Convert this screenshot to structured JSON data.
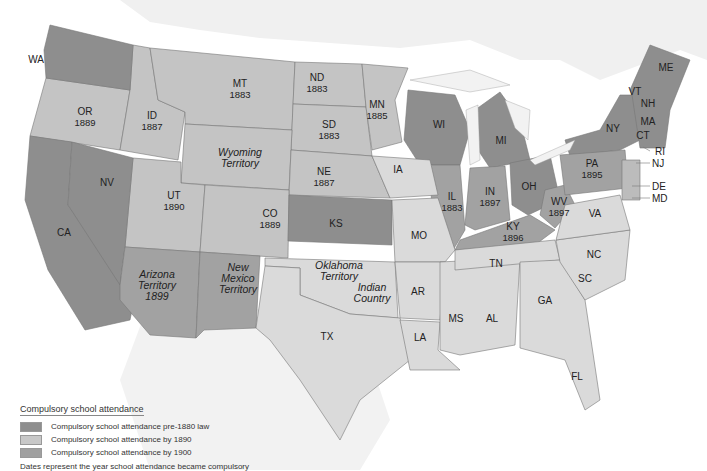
{
  "map": {
    "title": "Compulsory school attendance",
    "colors": {
      "pre1880": "#8e8e8e",
      "by1890": "#c4c4c4",
      "by1900": "#a2a2a2",
      "none": "#dcdcdc",
      "water": "#f4f4f4"
    },
    "labels": [
      {
        "id": "WA",
        "name": "WA",
        "year": "",
        "x": 36,
        "y": 59
      },
      {
        "id": "OR",
        "name": "OR",
        "year": "1889",
        "x": 85,
        "y": 117
      },
      {
        "id": "ID",
        "name": "ID",
        "year": "1887",
        "x": 152,
        "y": 121
      },
      {
        "id": "MT",
        "name": "MT",
        "year": "1883",
        "x": 240,
        "y": 89
      },
      {
        "id": "ND",
        "name": "ND",
        "year": "1883",
        "x": 317,
        "y": 83
      },
      {
        "id": "SD",
        "name": "SD",
        "year": "1883",
        "x": 329,
        "y": 130
      },
      {
        "id": "MN",
        "name": "MN",
        "year": "1885",
        "x": 377,
        "y": 110
      },
      {
        "id": "WY",
        "name": "Wyoming Territory",
        "year": "",
        "x": 240,
        "y": 158,
        "italic": true
      },
      {
        "id": "NE",
        "name": "NE",
        "year": "1887",
        "x": 324,
        "y": 177
      },
      {
        "id": "IA",
        "name": "IA",
        "year": "",
        "x": 398,
        "y": 169
      },
      {
        "id": "NV",
        "name": "NV",
        "year": "",
        "x": 107,
        "y": 182
      },
      {
        "id": "UT",
        "name": "UT",
        "year": "1890",
        "x": 174,
        "y": 201
      },
      {
        "id": "CO",
        "name": "CO",
        "year": "1889",
        "x": 270,
        "y": 219
      },
      {
        "id": "KS",
        "name": "KS",
        "year": "",
        "x": 336,
        "y": 223
      },
      {
        "id": "MO",
        "name": "MO",
        "year": "",
        "x": 419,
        "y": 235
      },
      {
        "id": "CA",
        "name": "CA",
        "year": "",
        "x": 64,
        "y": 232
      },
      {
        "id": "AZ",
        "name": "Arizona Territory 1899",
        "year": "",
        "x": 157,
        "y": 285,
        "italic": true
      },
      {
        "id": "NM",
        "name": "New Mexico Territory",
        "year": "",
        "x": 238,
        "y": 278,
        "italic": true
      },
      {
        "id": "OK",
        "name": "Oklahoma Territory",
        "year": "",
        "x": 339,
        "y": 271,
        "italic": true
      },
      {
        "id": "IC",
        "name": "Indian Country",
        "year": "",
        "x": 372,
        "y": 293,
        "italic": true
      },
      {
        "id": "TX",
        "name": "TX",
        "year": "",
        "x": 327,
        "y": 336
      },
      {
        "id": "AR",
        "name": "AR",
        "year": "",
        "x": 418,
        "y": 291
      },
      {
        "id": "LA",
        "name": "LA",
        "year": "",
        "x": 420,
        "y": 337
      },
      {
        "id": "MS",
        "name": "MS",
        "year": "",
        "x": 456,
        "y": 318
      },
      {
        "id": "AL",
        "name": "AL",
        "year": "",
        "x": 492,
        "y": 318
      },
      {
        "id": "GA",
        "name": "GA",
        "year": "",
        "x": 545,
        "y": 300
      },
      {
        "id": "FL",
        "name": "FL",
        "year": "",
        "x": 577,
        "y": 376
      },
      {
        "id": "SC",
        "name": "SC",
        "year": "",
        "x": 585,
        "y": 278
      },
      {
        "id": "NC",
        "name": "NC",
        "year": "",
        "x": 594,
        "y": 254
      },
      {
        "id": "TN",
        "name": "TN",
        "year": "",
        "x": 496,
        "y": 263
      },
      {
        "id": "KY",
        "name": "KY",
        "year": "1896",
        "x": 513,
        "y": 232
      },
      {
        "id": "VA",
        "name": "VA",
        "year": "",
        "x": 595,
        "y": 213
      },
      {
        "id": "WV",
        "name": "WV",
        "year": "1897",
        "x": 559,
        "y": 207
      },
      {
        "id": "IL",
        "name": "IL",
        "year": "1883",
        "x": 452,
        "y": 202
      },
      {
        "id": "IN",
        "name": "IN",
        "year": "1897",
        "x": 490,
        "y": 197
      },
      {
        "id": "OH",
        "name": "OH",
        "year": "",
        "x": 529,
        "y": 186
      },
      {
        "id": "WI",
        "name": "WI",
        "year": "",
        "x": 439,
        "y": 124
      },
      {
        "id": "MI",
        "name": "MI",
        "year": "",
        "x": 501,
        "y": 140
      },
      {
        "id": "PA",
        "name": "PA",
        "year": "1895",
        "x": 592,
        "y": 169
      },
      {
        "id": "NY",
        "name": "NY",
        "year": "",
        "x": 613,
        "y": 128
      },
      {
        "id": "VT",
        "name": "VT",
        "year": "",
        "x": 635,
        "y": 91
      },
      {
        "id": "NH",
        "name": "NH",
        "year": "",
        "x": 648,
        "y": 103
      },
      {
        "id": "MA",
        "name": "MA",
        "year": "",
        "x": 648,
        "y": 121
      },
      {
        "id": "CT",
        "name": "CT",
        "year": "",
        "x": 643,
        "y": 135
      },
      {
        "id": "ME",
        "name": "ME",
        "year": "",
        "x": 666,
        "y": 67
      }
    ],
    "external_labels": [
      {
        "id": "RI",
        "name": "RI",
        "x": 655,
        "y": 151
      },
      {
        "id": "NJ",
        "name": "NJ",
        "x": 652,
        "y": 163
      },
      {
        "id": "DE",
        "name": "DE",
        "x": 652,
        "y": 186
      },
      {
        "id": "MD",
        "name": "MD",
        "x": 652,
        "y": 198
      }
    ]
  },
  "legend": {
    "title": "Compulsory school attendance",
    "items": [
      {
        "label": "Compulsory school attendance pre-1880 law",
        "color": "#8e8e8e"
      },
      {
        "label": "Compulsory school attendance by 1890",
        "color": "#c8c8c8"
      },
      {
        "label": "Compulsory school attendance by 1900",
        "color": "#a0a0a0"
      }
    ],
    "note": "Dates represent the year school attendance became compulsory"
  }
}
